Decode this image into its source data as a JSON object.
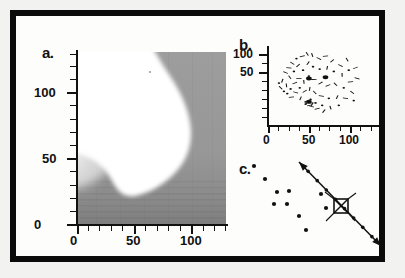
{
  "figure": {
    "background_color": "#f2f2f0",
    "frame_color": "#0b0b0b",
    "panel_count": 3
  },
  "panels": {
    "a": {
      "label": "a.",
      "xticks": [
        "0",
        "50",
        "100"
      ],
      "yticks": [
        "0",
        "50",
        "100"
      ],
      "xlim": [
        0,
        130
      ],
      "ylim": [
        0,
        130
      ]
    },
    "b": {
      "label": "b.",
      "xticks": [
        "0",
        "50",
        "100"
      ],
      "yticks": [
        "50",
        "100"
      ],
      "xlim": [
        0,
        130
      ],
      "ylim": [
        0,
        130
      ]
    },
    "c": {
      "label": "c.",
      "xticks": [],
      "yticks": []
    }
  },
  "chart_data": [
    {
      "type": "heatmap",
      "panel": "a",
      "title": "",
      "xlabel": "",
      "ylabel": "",
      "xlim": [
        0,
        130
      ],
      "ylim": [
        0,
        130
      ],
      "xtick_values": [
        0,
        50,
        100
      ],
      "ytick_values": [
        0,
        50,
        100
      ],
      "xtick_labels": [
        "0",
        "50",
        "100"
      ],
      "ytick_labels": [
        "0",
        "50",
        "100"
      ],
      "minor_ticks": true,
      "grid": false,
      "colormap": "grayscale",
      "description": "Grayscale density map: a large white (high-value) lobe occupies the centre, bounded by a curved edge that sweeps from the top-centre rightwards and down; the surrounding background is mid-grey with a smooth light-grey gradient along the lower-left flank and horizontal banding near the bottom.",
      "region_levels": [
        {
          "name": "white-lobe",
          "value": 1.0,
          "gray_hex": "#ffffff"
        },
        {
          "name": "soft-gradient-lower-left",
          "value": 0.55,
          "gray_hex": "#c9c9c9"
        },
        {
          "name": "background-field",
          "value": 0.35,
          "gray_hex": "#9a9a9a"
        },
        {
          "name": "dark-bands-bottom",
          "value": 0.2,
          "gray_hex": "#7e7e7e"
        }
      ],
      "lobe_boundary": [
        [
          57,
          130
        ],
        [
          64,
          128
        ],
        [
          74,
          122
        ],
        [
          86,
          112
        ],
        [
          97,
          98
        ],
        [
          105,
          82
        ],
        [
          108,
          66
        ],
        [
          106,
          52
        ],
        [
          99,
          40
        ],
        [
          88,
          30
        ],
        [
          76,
          22
        ],
        [
          66,
          18
        ],
        [
          58,
          16
        ],
        [
          52,
          18
        ],
        [
          47,
          25
        ],
        [
          42,
          33
        ],
        [
          36,
          40
        ],
        [
          30,
          48
        ],
        [
          24,
          57
        ],
        [
          20,
          68
        ],
        [
          18,
          82
        ],
        [
          18,
          98
        ],
        [
          20,
          112
        ],
        [
          24,
          124
        ],
        [
          28,
          130
        ]
      ]
    },
    {
      "type": "scatter",
      "panel": "b",
      "title": "",
      "xlabel": "",
      "ylabel": "",
      "xlim": [
        0,
        130
      ],
      "ylim": [
        0,
        130
      ],
      "xtick_values": [
        0,
        50,
        100
      ],
      "ytick_values": [
        50,
        100
      ],
      "xtick_labels": [
        "0",
        "50",
        "100"
      ],
      "ytick_labels": [
        "50",
        "100"
      ],
      "grid": false,
      "marker_color": "#111111",
      "description": "Dense cloud of tiny dark dots and short dashes tracing a kidney/leaf-shaped outline, with two heavier clusters near (48,78) and (68,80) and a third near (48,38).",
      "points": [
        [
          12,
          70
        ],
        [
          14,
          62
        ],
        [
          16,
          74
        ],
        [
          18,
          56
        ],
        [
          20,
          88
        ],
        [
          21,
          66
        ],
        [
          22,
          52
        ],
        [
          24,
          96
        ],
        [
          25,
          80
        ],
        [
          26,
          60
        ],
        [
          27,
          46
        ],
        [
          28,
          104
        ],
        [
          30,
          90
        ],
        [
          31,
          70
        ],
        [
          32,
          54
        ],
        [
          33,
          112
        ],
        [
          35,
          100
        ],
        [
          36,
          78
        ],
        [
          37,
          62
        ],
        [
          38,
          44
        ],
        [
          40,
          116
        ],
        [
          41,
          92
        ],
        [
          42,
          72
        ],
        [
          43,
          56
        ],
        [
          44,
          38
        ],
        [
          46,
          120
        ],
        [
          47,
          104
        ],
        [
          48,
          82
        ],
        [
          48,
          78
        ],
        [
          49,
          60
        ],
        [
          50,
          42
        ],
        [
          51,
          30
        ],
        [
          52,
          118
        ],
        [
          53,
          98
        ],
        [
          54,
          76
        ],
        [
          55,
          54
        ],
        [
          56,
          36
        ],
        [
          58,
          26
        ],
        [
          60,
          112
        ],
        [
          61,
          94
        ],
        [
          62,
          70
        ],
        [
          63,
          48
        ],
        [
          64,
          32
        ],
        [
          66,
          22
        ],
        [
          68,
          116
        ],
        [
          68,
          80
        ],
        [
          70,
          96
        ],
        [
          71,
          66
        ],
        [
          72,
          44
        ],
        [
          74,
          28
        ],
        [
          76,
          108
        ],
        [
          78,
          90
        ],
        [
          80,
          68
        ],
        [
          82,
          46
        ],
        [
          84,
          32
        ],
        [
          86,
          100
        ],
        [
          88,
          84
        ],
        [
          90,
          62
        ],
        [
          92,
          44
        ],
        [
          94,
          110
        ],
        [
          96,
          92
        ],
        [
          98,
          72
        ],
        [
          100,
          54
        ],
        [
          102,
          40
        ],
        [
          104,
          96
        ],
        [
          106,
          78
        ],
        [
          48,
          38
        ],
        [
          46,
          36
        ],
        [
          50,
          36
        ],
        [
          44,
          34
        ],
        [
          52,
          34
        ],
        [
          49,
          32
        ]
      ],
      "clusters": [
        {
          "center": [
            48,
            78
          ],
          "label": "cluster-1"
        },
        {
          "center": [
            68,
            80
          ],
          "label": "cluster-2"
        },
        {
          "center": [
            48,
            38
          ],
          "label": "cluster-3"
        }
      ]
    },
    {
      "type": "scatter",
      "panel": "c",
      "title": "",
      "xlabel": "",
      "ylabel": "",
      "grid": false,
      "marker_color": "#111111",
      "description": "Sparse scatter of ~10 round dots in the left half, plus a double-headed diagonal arrow running from upper-right down to lower-right through a boxed-X (crossed square) symbol.",
      "dots": [
        [
          33,
          12
        ],
        [
          44,
          25
        ],
        [
          56,
          38
        ],
        [
          53,
          50
        ],
        [
          68,
          37
        ],
        [
          66,
          50
        ],
        [
          78,
          62
        ],
        [
          85,
          76
        ],
        [
          100,
          40
        ],
        [
          105,
          54
        ]
      ],
      "arrow": {
        "from": [
          78,
          8
        ],
        "to": [
          160,
          92
        ],
        "double_headed": true,
        "passes_through_symbol": true
      },
      "symbol": {
        "name": "crossed-square",
        "center": [
          120,
          52
        ],
        "size": 14
      }
    }
  ]
}
